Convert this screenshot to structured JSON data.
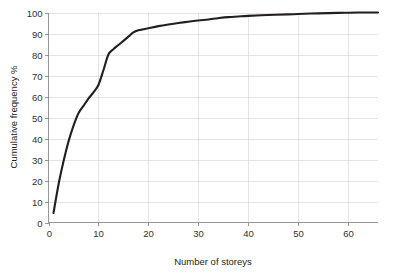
{
  "chart_data": {
    "type": "line",
    "title": "",
    "subtitle": "",
    "xlabel": "Number of storeys",
    "ylabel": "Cumulative frequency %",
    "xlim": [
      0,
      66
    ],
    "ylim": [
      0,
      100
    ],
    "xticks": [
      0,
      10,
      20,
      30,
      40,
      50,
      60
    ],
    "yticks": [
      0,
      10,
      20,
      30,
      40,
      50,
      60,
      70,
      80,
      90,
      100
    ],
    "xtick_labels": [
      "0",
      "10",
      "20",
      "30",
      "40",
      "50",
      "60"
    ],
    "ytick_labels": [
      "0",
      "10",
      "20",
      "30",
      "40",
      "50",
      "60",
      "70",
      "80",
      "90",
      "100"
    ],
    "grid": {
      "horizontal": true,
      "vertical": true,
      "color": "#d8d8d8"
    },
    "legend": {
      "visible": false,
      "position": "none",
      "entries": []
    },
    "annotations": [],
    "series": [
      {
        "name": "Cumulative frequency",
        "color": "#231f20",
        "line_width": 2.1,
        "markers": false,
        "x": [
          1,
          2,
          3,
          4,
          5,
          6,
          7,
          8,
          9,
          10,
          11,
          12,
          13,
          14,
          15,
          16,
          17,
          18,
          19,
          20,
          22,
          24,
          26,
          28,
          30,
          32,
          34,
          36,
          38,
          40,
          44,
          48,
          50,
          54,
          58,
          62,
          66
        ],
        "values": [
          4.5,
          18,
          29,
          38.5,
          46,
          52,
          55.5,
          59,
          62,
          65.5,
          72.5,
          80,
          82.5,
          84.5,
          86.5,
          88.5,
          90.5,
          91.5,
          92,
          92.5,
          93.5,
          94.3,
          95,
          95.6,
          96.2,
          96.7,
          97.3,
          97.8,
          98.1,
          98.4,
          98.8,
          99.1,
          99.3,
          99.6,
          99.8,
          100,
          100
        ]
      }
    ]
  },
  "axes": {
    "x_title": "Number of storeys",
    "y_title": "Cumulative frequency %"
  }
}
